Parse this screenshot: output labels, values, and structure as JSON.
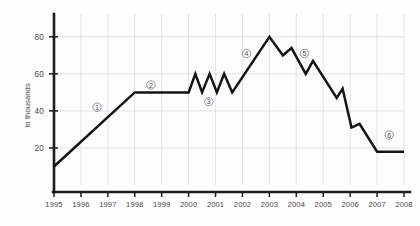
{
  "chart_data": {
    "type": "line",
    "title": "",
    "xlabel": "",
    "ylabel": "In thousands",
    "xlim": [
      1995,
      2008
    ],
    "ylim": [
      0,
      88
    ],
    "grid": true,
    "legend": "none",
    "x_tick_labels": [
      "1995",
      "1996",
      "1997",
      "1998",
      "1999",
      "2000",
      "2001",
      "2002",
      "2003",
      "2004",
      "2005",
      "2006",
      "2007",
      "2008"
    ],
    "y_tick_labels": [
      "20",
      "40",
      "60",
      "80"
    ],
    "y_ticks": [
      20,
      40,
      60,
      80
    ],
    "series": [
      {
        "name": "value",
        "points": [
          {
            "x": 1995.0,
            "y": 10
          },
          {
            "x": 1998.0,
            "y": 50
          },
          {
            "x": 2000.0,
            "y": 50
          },
          {
            "x": 2000.25,
            "y": 60
          },
          {
            "x": 2000.5,
            "y": 50
          },
          {
            "x": 2000.78,
            "y": 60
          },
          {
            "x": 2001.05,
            "y": 50
          },
          {
            "x": 2001.32,
            "y": 60
          },
          {
            "x": 2001.62,
            "y": 50
          },
          {
            "x": 2003.0,
            "y": 80
          },
          {
            "x": 2003.5,
            "y": 70
          },
          {
            "x": 2003.82,
            "y": 74
          },
          {
            "x": 2004.35,
            "y": 60
          },
          {
            "x": 2004.62,
            "y": 67
          },
          {
            "x": 2005.5,
            "y": 47
          },
          {
            "x": 2005.72,
            "y": 52
          },
          {
            "x": 2006.05,
            "y": 31
          },
          {
            "x": 2006.35,
            "y": 33
          },
          {
            "x": 2007.0,
            "y": 18
          },
          {
            "x": 2008.0,
            "y": 18
          }
        ]
      }
    ],
    "annotations": [
      {
        "label": "1",
        "x": 1996.6,
        "y": 42
      },
      {
        "label": "2",
        "x": 1998.6,
        "y": 54
      },
      {
        "label": "3",
        "x": 2000.75,
        "y": 45
      },
      {
        "label": "4",
        "x": 2002.15,
        "y": 71
      },
      {
        "label": "5",
        "x": 2004.3,
        "y": 71
      },
      {
        "label": "6",
        "x": 2007.45,
        "y": 27
      }
    ]
  },
  "colors": {
    "line": "#141414",
    "axis": "#1d1d1d",
    "grid": "#d9d9dd",
    "text": "#4a4a4a",
    "marker": "#7a7a80",
    "background": "#fdfdfd"
  }
}
